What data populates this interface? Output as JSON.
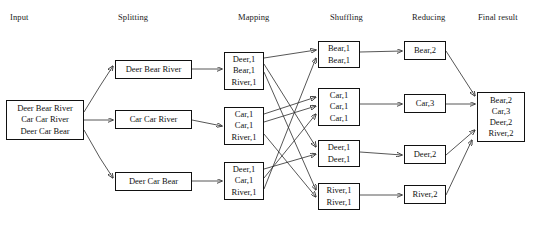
{
  "diagram": {
    "stroke_color": "#2b2b2b",
    "box_border_color": "#111111",
    "background": "#ffffff",
    "text_color": "#111111"
  },
  "headers": [
    {
      "id": "input",
      "label": "Input",
      "x": 10,
      "y": 12
    },
    {
      "id": "splitting",
      "label": "Splitting",
      "x": 118,
      "y": 12
    },
    {
      "id": "mapping",
      "label": "Mapping",
      "x": 238,
      "y": 12
    },
    {
      "id": "shuffling",
      "label": "Shuffling",
      "x": 330,
      "y": 12
    },
    {
      "id": "reducing",
      "label": "Reducing",
      "x": 412,
      "y": 12
    },
    {
      "id": "final",
      "label": "Final result",
      "x": 478,
      "y": 12
    }
  ],
  "nodes": {
    "input": [
      {
        "id": "input-box",
        "lines": [
          "Deer Bear River",
          "Car Car River",
          "Deer Car Bear"
        ],
        "x": 6,
        "y": 100,
        "w": 78,
        "h": 40
      }
    ],
    "splitting": [
      {
        "id": "split-1",
        "lines": [
          "Deer Bear River"
        ],
        "x": 115,
        "y": 60,
        "w": 77,
        "h": 19
      },
      {
        "id": "split-2",
        "lines": [
          "Car Car River"
        ],
        "x": 115,
        "y": 110,
        "w": 77,
        "h": 19
      },
      {
        "id": "split-3",
        "lines": [
          "Deer Car Bear"
        ],
        "x": 115,
        "y": 172,
        "w": 77,
        "h": 19
      }
    ],
    "mapping": [
      {
        "id": "map-1",
        "lines": [
          "Deer,1",
          "Bear,1",
          "River,1"
        ],
        "x": 224,
        "y": 52,
        "w": 40,
        "h": 38
      },
      {
        "id": "map-2",
        "lines": [
          "Car,1",
          "Car,1",
          "River,1"
        ],
        "x": 224,
        "y": 107,
        "w": 40,
        "h": 38
      },
      {
        "id": "map-3",
        "lines": [
          "Deer,1",
          "Car,1",
          "River,1"
        ],
        "x": 224,
        "y": 162,
        "w": 40,
        "h": 38
      }
    ],
    "shuffling": [
      {
        "id": "shuffle-bear",
        "lines": [
          "Bear,1",
          "Bear,1"
        ],
        "x": 318,
        "y": 41,
        "w": 42,
        "h": 27
      },
      {
        "id": "shuffle-car",
        "lines": [
          "Car,1",
          "Car,1",
          "Car,1"
        ],
        "x": 318,
        "y": 88,
        "w": 42,
        "h": 38
      },
      {
        "id": "shuffle-deer",
        "lines": [
          "Deer,1",
          "Deer,1"
        ],
        "x": 318,
        "y": 140,
        "w": 42,
        "h": 27
      },
      {
        "id": "shuffle-river",
        "lines": [
          "River,1",
          "River,1"
        ],
        "x": 318,
        "y": 183,
        "w": 42,
        "h": 27
      }
    ],
    "reducing": [
      {
        "id": "reduce-bear",
        "lines": [
          "Bear,2"
        ],
        "x": 404,
        "y": 41,
        "w": 42,
        "h": 19
      },
      {
        "id": "reduce-car",
        "lines": [
          "Car,3"
        ],
        "x": 404,
        "y": 94,
        "w": 42,
        "h": 19
      },
      {
        "id": "reduce-deer",
        "lines": [
          "Deer,2"
        ],
        "x": 404,
        "y": 145,
        "w": 42,
        "h": 19
      },
      {
        "id": "reduce-river",
        "lines": [
          "River,2"
        ],
        "x": 404,
        "y": 185,
        "w": 42,
        "h": 19
      }
    ],
    "final": [
      {
        "id": "final-box",
        "lines": [
          "Bear,2",
          "Car,3",
          "Deer,2",
          "River,2"
        ],
        "x": 477,
        "y": 92,
        "w": 48,
        "h": 50
      }
    ]
  },
  "edges": [
    {
      "id": "input-to-split-1",
      "from": "input-box",
      "to": "split-1",
      "type": "diagonal"
    },
    {
      "id": "input-to-split-2",
      "from": "input-box",
      "to": "split-2",
      "type": "straight"
    },
    {
      "id": "input-to-split-3",
      "from": "input-box",
      "to": "split-3",
      "type": "diagonal"
    },
    {
      "id": "split-1-to-map-1",
      "from": "split-1",
      "to": "map-1",
      "type": "straight"
    },
    {
      "id": "split-2-to-map-2",
      "from": "split-2",
      "to": "map-2",
      "type": "straight"
    },
    {
      "id": "split-3-to-map-3",
      "from": "split-3",
      "to": "map-3",
      "type": "straight"
    },
    {
      "id": "map-1-bear-to-shuffle-bear",
      "from": "map-1",
      "to": "shuffle-bear",
      "type": "shuffle"
    },
    {
      "id": "map-1-deer-to-shuffle-deer",
      "from": "map-1",
      "to": "shuffle-deer",
      "type": "shuffle"
    },
    {
      "id": "map-1-river-to-shuffle-river",
      "from": "map-1",
      "to": "shuffle-river",
      "type": "shuffle"
    },
    {
      "id": "map-2-car-to-shuffle-car-a",
      "from": "map-2",
      "to": "shuffle-car",
      "type": "shuffle"
    },
    {
      "id": "map-2-car-to-shuffle-car-b",
      "from": "map-2",
      "to": "shuffle-car",
      "type": "shuffle"
    },
    {
      "id": "map-2-river-to-shuffle-river",
      "from": "map-2",
      "to": "shuffle-river",
      "type": "shuffle"
    },
    {
      "id": "map-3-deer-to-shuffle-deer",
      "from": "map-3",
      "to": "shuffle-deer",
      "type": "shuffle"
    },
    {
      "id": "map-3-car-to-shuffle-car",
      "from": "map-3",
      "to": "shuffle-car",
      "type": "shuffle"
    },
    {
      "id": "map-3-bear-to-shuffle-bear",
      "from": "map-3",
      "to": "shuffle-bear",
      "type": "shuffle"
    },
    {
      "id": "shuffle-bear-to-reduce-bear",
      "from": "shuffle-bear",
      "to": "reduce-bear",
      "type": "straight"
    },
    {
      "id": "shuffle-car-to-reduce-car",
      "from": "shuffle-car",
      "to": "reduce-car",
      "type": "straight"
    },
    {
      "id": "shuffle-deer-to-reduce-deer",
      "from": "shuffle-deer",
      "to": "reduce-deer",
      "type": "straight"
    },
    {
      "id": "shuffle-river-to-reduce-river",
      "from": "shuffle-river",
      "to": "reduce-river",
      "type": "straight"
    },
    {
      "id": "reduce-bear-to-final",
      "from": "reduce-bear",
      "to": "final-box",
      "type": "diagonal"
    },
    {
      "id": "reduce-car-to-final",
      "from": "reduce-car",
      "to": "final-box",
      "type": "straight"
    },
    {
      "id": "reduce-deer-to-final",
      "from": "reduce-deer",
      "to": "final-box",
      "type": "straight"
    },
    {
      "id": "reduce-river-to-final",
      "from": "reduce-river",
      "to": "final-box",
      "type": "diagonal"
    }
  ],
  "wire_paths": {
    "input_split": [
      "M 84,112 L 100,86 L 113,66",
      "M 84,120 L 113,120",
      "M 84,130 L 100,158 L 113,178"
    ],
    "split_map": [
      "M 192,69 L 222,69",
      "M 192,120 L 222,126",
      "M 192,181 L 222,181"
    ],
    "shuffle_cross": [
      "M 264,58 L 316,50",
      "M 264,64 L 316,147",
      "M 264,72 L 316,190",
      "M 264,114 L 316,97",
      "M 264,122 L 316,106",
      "M 264,134 L 316,197",
      "M 264,169 L 316,154",
      "M 264,178 L 316,114",
      "M 264,189 L 316,58"
    ],
    "shuffle_reduce": [
      "M 360,52 L 402,51",
      "M 360,104 L 402,104",
      "M 360,152 L 402,155",
      "M 360,195 L 402,195"
    ],
    "reduce_final": [
      "M 446,51 L 475,96",
      "M 446,104 L 475,104",
      "M 446,155 L 475,130",
      "M 446,195 L 472,140"
    ]
  },
  "arrow_marker": {
    "id": "arrowhead",
    "size": 5
  }
}
